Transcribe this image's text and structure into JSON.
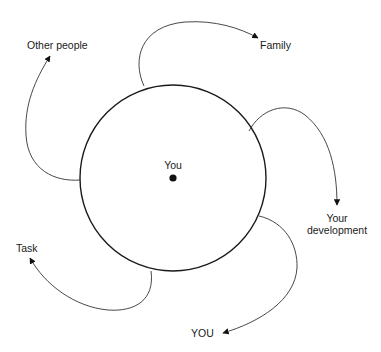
{
  "diagram": {
    "center_label": "You",
    "labels": {
      "other_people": "Other people",
      "family": "Family",
      "your_development_line1": "Your",
      "your_development_line2": "development",
      "task": "Task",
      "you_caps": "YOU"
    },
    "nodes": [
      {
        "id": "center",
        "label": "You",
        "type": "circle-center-dot"
      },
      {
        "id": "other_people",
        "label": "Other people"
      },
      {
        "id": "family",
        "label": "Family"
      },
      {
        "id": "your_development",
        "label": "Your development"
      },
      {
        "id": "you",
        "label": "YOU"
      },
      {
        "id": "task",
        "label": "Task"
      }
    ],
    "edges": [
      {
        "from": "circle",
        "to": "other_people"
      },
      {
        "from": "circle",
        "to": "family"
      },
      {
        "from": "circle",
        "to": "your_development"
      },
      {
        "from": "circle",
        "to": "you"
      },
      {
        "from": "circle",
        "to": "task"
      }
    ],
    "colors": {
      "stroke": "#1a1a1a",
      "background": "#ffffff"
    }
  }
}
